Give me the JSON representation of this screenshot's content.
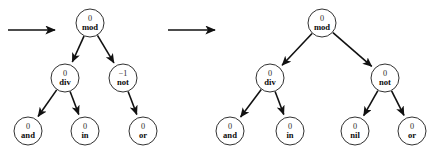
{
  "figure": {
    "background_color": "#ffffff",
    "node_fill": "#ffffff",
    "node_stroke": "#1a1a1a",
    "edge_color": "#111111",
    "width": 439,
    "height": 160
  },
  "transitions": [
    {
      "name": "transition-arrow-1",
      "symbol": "→",
      "x1": 8,
      "y1": 30,
      "x2": 55,
      "y2": 30
    },
    {
      "name": "transition-arrow-2",
      "symbol": "→",
      "x1": 168,
      "y1": 30,
      "x2": 215,
      "y2": 30
    }
  ],
  "trees": [
    {
      "name": "tree-left",
      "nodes": [
        {
          "id": "L-root",
          "value": "0",
          "label": "mod",
          "cx": 90,
          "cy": 23,
          "r": 14
        },
        {
          "id": "L-div",
          "value": "0",
          "label": "div",
          "cx": 65,
          "cy": 78,
          "r": 14
        },
        {
          "id": "L-not",
          "value": "−1",
          "label": "not",
          "cx": 123,
          "cy": 78,
          "r": 14
        },
        {
          "id": "L-and",
          "value": "0",
          "label": "and",
          "cx": 28,
          "cy": 131,
          "r": 14
        },
        {
          "id": "L-in",
          "value": "0",
          "label": "in",
          "cx": 85,
          "cy": 131,
          "r": 14
        },
        {
          "id": "L-or",
          "value": "0",
          "label": "or",
          "cx": 143,
          "cy": 131,
          "r": 14
        }
      ],
      "edges": [
        {
          "from": "L-root",
          "to": "L-div"
        },
        {
          "from": "L-root",
          "to": "L-not"
        },
        {
          "from": "L-div",
          "to": "L-and"
        },
        {
          "from": "L-div",
          "to": "L-in"
        },
        {
          "from": "L-not",
          "to": "L-or"
        }
      ]
    },
    {
      "name": "tree-right",
      "nodes": [
        {
          "id": "R-root",
          "value": "0",
          "label": "mod",
          "cx": 322,
          "cy": 23,
          "r": 14
        },
        {
          "id": "R-div",
          "value": "0",
          "label": "div",
          "cx": 270,
          "cy": 78,
          "r": 14
        },
        {
          "id": "R-not",
          "value": "0",
          "label": "not",
          "cx": 385,
          "cy": 78,
          "r": 14
        },
        {
          "id": "R-and",
          "value": "0",
          "label": "and",
          "cx": 230,
          "cy": 131,
          "r": 14
        },
        {
          "id": "R-in",
          "value": "0",
          "label": "in",
          "cx": 290,
          "cy": 131,
          "r": 14
        },
        {
          "id": "R-nil",
          "value": "0",
          "label": "nil",
          "cx": 355,
          "cy": 131,
          "r": 14
        },
        {
          "id": "R-or",
          "value": "0",
          "label": "or",
          "cx": 412,
          "cy": 131,
          "r": 14
        }
      ],
      "edges": [
        {
          "from": "R-root",
          "to": "R-div"
        },
        {
          "from": "R-root",
          "to": "R-not"
        },
        {
          "from": "R-div",
          "to": "R-and"
        },
        {
          "from": "R-div",
          "to": "R-in"
        },
        {
          "from": "R-not",
          "to": "R-nil"
        },
        {
          "from": "R-not",
          "to": "R-or"
        }
      ]
    }
  ]
}
